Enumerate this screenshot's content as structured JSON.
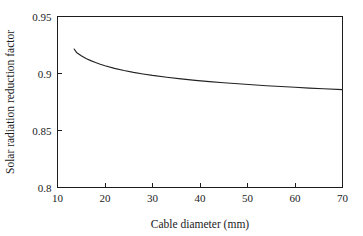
{
  "chart_data": {
    "type": "line",
    "title": "",
    "xlabel": "Cable diameter (mm)",
    "ylabel": "Solar radiation reduction factor",
    "xlim": [
      10,
      70
    ],
    "ylim": [
      0.8,
      0.95
    ],
    "xticks": [
      10,
      20,
      30,
      40,
      50,
      60,
      70
    ],
    "xtick_labels": [
      "10",
      "20",
      "30",
      "40",
      "50",
      "60",
      "70"
    ],
    "yticks": [
      0.8,
      0.85,
      0.9,
      0.95
    ],
    "ytick_labels": [
      "0.8",
      "0.85",
      "0.9",
      "0.95"
    ],
    "grid": false,
    "legend": null,
    "series": [
      {
        "name": "Solar radiation reduction factor",
        "color": "#232323",
        "x": [
          13.5,
          14,
          15,
          16,
          17,
          18,
          19,
          20,
          22,
          24,
          26,
          28,
          30,
          33,
          36,
          39,
          42,
          45,
          48,
          51,
          54,
          57,
          60,
          63,
          66,
          70
        ],
        "values": [
          0.9215,
          0.9185,
          0.9155,
          0.9132,
          0.9113,
          0.9096,
          0.9081,
          0.9068,
          0.9045,
          0.9026,
          0.901,
          0.8996,
          0.8983,
          0.8967,
          0.8953,
          0.894,
          0.8929,
          0.8919,
          0.891,
          0.8901,
          0.8893,
          0.8886,
          0.8879,
          0.8872,
          0.8866,
          0.8858
        ]
      }
    ]
  },
  "axes": {
    "x_axis_label": "Cable diameter (mm)",
    "y_axis_label": "Solar radiation reduction factor"
  }
}
